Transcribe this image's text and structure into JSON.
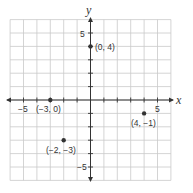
{
  "chart_data": {
    "type": "scatter",
    "title": "",
    "xlabel": "x",
    "ylabel": "y",
    "xlim": [
      -6,
      6
    ],
    "ylim": [
      -6,
      6
    ],
    "grid": true,
    "x_tick_labels": [
      {
        "value": -5,
        "label": "−5"
      },
      {
        "value": 5,
        "label": "5"
      }
    ],
    "y_tick_labels": [
      {
        "value": 5,
        "label": "5"
      },
      {
        "value": -5,
        "label": "−5"
      }
    ],
    "points": [
      {
        "x": 0,
        "y": 4,
        "label": "(0, 4)"
      },
      {
        "x": -3,
        "y": 0,
        "label": "(−3, 0)"
      },
      {
        "x": 4,
        "y": -1,
        "label": "(4, −1)"
      },
      {
        "x": -2,
        "y": -3,
        "label": "(−2, −3)"
      }
    ]
  },
  "colors": {
    "grid": "#c9c9c9",
    "axis": "#333333",
    "point": "#333333"
  }
}
